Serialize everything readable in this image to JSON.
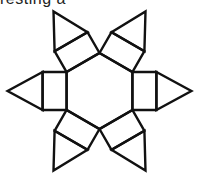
{
  "caption": "resting a",
  "diagram": {
    "type": "net",
    "center": [
      99.5,
      91
    ],
    "hex_side": 38,
    "rect_depth": 24,
    "triangle_height": 35,
    "stroke_color": "#111111",
    "fill_color": "#ffffff"
  }
}
